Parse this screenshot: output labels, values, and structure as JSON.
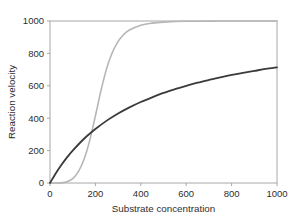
{
  "chart_data": {
    "type": "line",
    "title": "",
    "subtitle": "",
    "xlabel": "Substrate concentration",
    "ylabel": "Reaction velocity",
    "xlim": [
      0,
      1000
    ],
    "ylim": [
      0,
      1000
    ],
    "xticks": [
      0,
      200,
      400,
      600,
      800,
      1000
    ],
    "yticks": [
      0,
      200,
      400,
      600,
      800,
      1000
    ],
    "xticklabels": [
      "0",
      "200",
      "400",
      "600",
      "800",
      "1000"
    ],
    "yticklabels": [
      "0",
      "200",
      "400",
      "600",
      "800",
      "1000"
    ],
    "grid": false,
    "legend": "none",
    "annotations": [],
    "series": [
      {
        "name": "hyperbolic-michaelis-menten",
        "color": "#3a3a3a",
        "linewidth": 1.8,
        "model": "v = Vmax * S / (Km + S)",
        "Vmax": 1000,
        "Km": 400,
        "x": [
          0,
          25,
          50,
          75,
          100,
          150,
          200,
          250,
          300,
          350,
          400,
          450,
          500,
          550,
          600,
          650,
          700,
          750,
          800,
          850,
          900,
          950,
          1000
        ],
        "y": [
          0,
          59,
          111,
          158,
          200,
          273,
          333,
          385,
          429,
          467,
          500,
          529,
          556,
          579,
          600,
          619,
          636,
          652,
          667,
          680,
          692,
          704,
          714
        ]
      },
      {
        "name": "sigmoidal-cooperative-hill",
        "color": "#b6b6b6",
        "linewidth": 1.6,
        "model": "v = Vmax * S^n / (K^n + S^n)",
        "Vmax": 1000,
        "K": 205,
        "n": 5,
        "x": [
          0,
          25,
          50,
          75,
          100,
          125,
          150,
          175,
          200,
          225,
          250,
          275,
          300,
          325,
          350,
          400,
          450,
          500,
          600,
          700,
          800,
          900,
          1000
        ],
        "y": [
          0,
          0,
          1,
          8,
          27,
          70,
          146,
          263,
          414,
          573,
          709,
          807,
          874,
          917,
          944,
          974,
          987,
          993,
          998,
          999,
          1000,
          1000,
          1000
        ]
      }
    ]
  },
  "axes": {
    "x_label": "Substrate concentration",
    "y_label": "Reaction velocity",
    "x_tick_0": "0",
    "x_tick_1": "200",
    "x_tick_2": "400",
    "x_tick_3": "600",
    "x_tick_4": "800",
    "x_tick_5": "1000",
    "y_tick_0": "0",
    "y_tick_1": "200",
    "y_tick_2": "400",
    "y_tick_3": "600",
    "y_tick_4": "800",
    "y_tick_5": "1000"
  },
  "colors": {
    "curve_dark": "#3a3a3a",
    "curve_light": "#b6b6b6",
    "frame": "#a8a8a8",
    "text": "#2e2e2e",
    "background": "#ffffff"
  }
}
